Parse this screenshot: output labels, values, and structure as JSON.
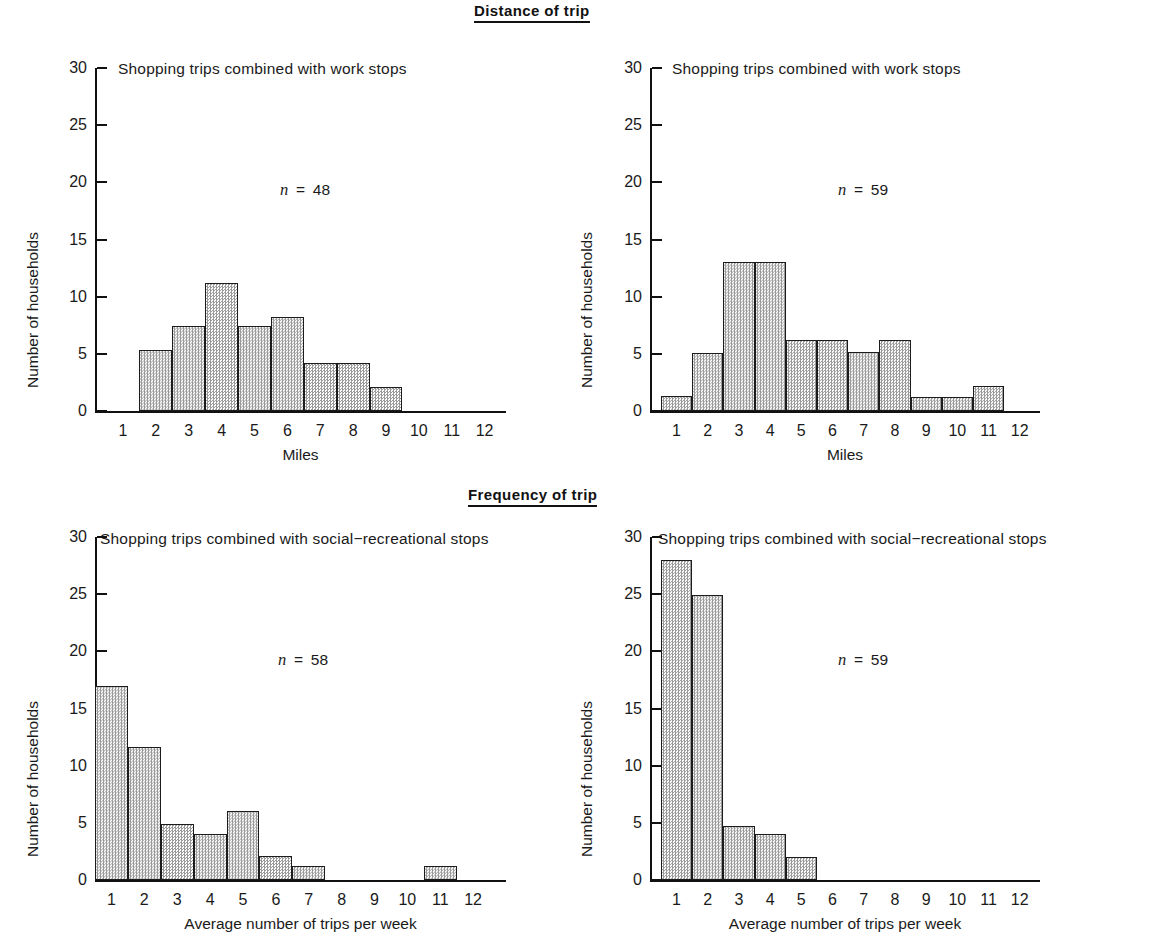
{
  "sections": {
    "distance": "Distance of trip",
    "frequency": "Frequency of trip"
  },
  "axis_labels": {
    "y": "Number of households",
    "x_miles": "Miles",
    "x_trips": "Average number of trips per week"
  },
  "chart_data": [
    {
      "id": "top-left",
      "type": "bar",
      "title": "Shopping trips combined with work stops",
      "section": "Distance of trip",
      "annotation": "n = 48",
      "n": 48,
      "xlabel": "Miles",
      "ylabel": "Number of households",
      "categories": [
        1,
        2,
        3,
        4,
        5,
        6,
        7,
        8,
        9,
        10,
        11,
        12
      ],
      "xticklabels": [
        "1",
        "2",
        "3",
        "4",
        "5",
        "6",
        "7",
        "8",
        "9",
        "10",
        "11",
        "12"
      ],
      "values": [
        0,
        5.3,
        7.4,
        11.2,
        7.4,
        8.2,
        4.2,
        4.2,
        2.1,
        0,
        0,
        0
      ],
      "yticks": [
        0,
        5,
        10,
        15,
        20,
        25,
        30
      ],
      "yticklabels": [
        "0",
        "5",
        "10",
        "15",
        "20",
        "25",
        "30"
      ],
      "ylim": [
        0,
        30
      ],
      "grid": false,
      "legend": false
    },
    {
      "id": "top-right",
      "type": "bar",
      "title": "Shopping trips combined with work stops",
      "section": "Distance of trip",
      "annotation": "n = 59",
      "n": 59,
      "xlabel": "Miles",
      "ylabel": "Number of households",
      "categories": [
        1,
        2,
        3,
        4,
        5,
        6,
        7,
        8,
        9,
        10,
        11,
        12
      ],
      "xticklabels": [
        "1",
        "2",
        "3",
        "4",
        "5",
        "6",
        "7",
        "8",
        "9",
        "10",
        "11",
        "12"
      ],
      "values": [
        1.3,
        5.1,
        13.0,
        13.0,
        6.2,
        6.2,
        5.2,
        6.2,
        1.2,
        1.2,
        2.2,
        0
      ],
      "yticks": [
        0,
        5,
        10,
        15,
        20,
        25,
        30
      ],
      "yticklabels": [
        "0",
        "5",
        "10",
        "15",
        "20",
        "25",
        "30"
      ],
      "ylim": [
        0,
        30
      ],
      "grid": false,
      "legend": false
    },
    {
      "id": "bottom-left",
      "type": "bar",
      "title": "Shopping trips combined with social−recreational stops",
      "section": "Frequency of trip",
      "annotation": "n = 58",
      "n": 58,
      "xlabel": "Average number of trips per week",
      "ylabel": "Number of households",
      "categories": [
        1,
        2,
        3,
        4,
        5,
        6,
        7,
        8,
        9,
        10,
        11,
        12
      ],
      "xticklabels": [
        "1",
        "2",
        "3",
        "4",
        "5",
        "6",
        "7",
        "8",
        "9",
        "10",
        "11",
        "12"
      ],
      "values": [
        17.0,
        11.6,
        4.9,
        4.0,
        6.0,
        2.1,
        1.2,
        0,
        0,
        0,
        1.2,
        0
      ],
      "yticks": [
        0,
        5,
        10,
        15,
        20,
        25,
        30
      ],
      "yticklabels": [
        "0",
        "5",
        "10",
        "15",
        "20",
        "25",
        "30"
      ],
      "ylim": [
        0,
        30
      ],
      "grid": false,
      "legend": false
    },
    {
      "id": "bottom-right",
      "type": "bar",
      "title": "Shopping trips combined with social−recreational stops",
      "section": "Frequency of trip",
      "annotation": "n = 59",
      "n": 59,
      "xlabel": "Average number of trips per week",
      "ylabel": "Number of households",
      "categories": [
        1,
        2,
        3,
        4,
        5,
        6,
        7,
        8,
        9,
        10,
        11,
        12
      ],
      "xticklabels": [
        "1",
        "2",
        "3",
        "4",
        "5",
        "6",
        "7",
        "8",
        "9",
        "10",
        "11",
        "12"
      ],
      "values": [
        28.0,
        24.9,
        4.7,
        4.0,
        2.0,
        0,
        0,
        0,
        0,
        0,
        0,
        0
      ],
      "yticks": [
        0,
        5,
        10,
        15,
        20,
        25,
        30
      ],
      "yticklabels": [
        "0",
        "5",
        "10",
        "15",
        "20",
        "25",
        "30"
      ],
      "ylim": [
        0,
        30
      ],
      "grid": false,
      "legend": false
    }
  ],
  "colors": {
    "ink": "#111111",
    "bar_fill": "#e2e2e2",
    "bar_edge": "#1c1c1c"
  }
}
